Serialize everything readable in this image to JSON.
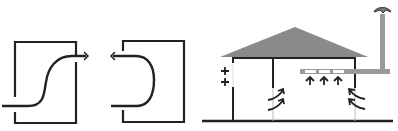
{
  "diagram": {
    "title": "",
    "panels": [
      {
        "id": "s-flow-box",
        "description": "Box with S-shaped airflow entering bottom-left and exiting top-right"
      },
      {
        "id": "u-turn-box",
        "description": "Box with U-shaped airflow entering and exiting the left side"
      },
      {
        "id": "house-ventilation",
        "description": "House with pitched roof, side wall vents, ceiling duct with grilles, chimney with rotating cowl and curved airflow arrows"
      }
    ],
    "colors": {
      "line": "#222222",
      "roof": "#8a8a8a",
      "duct": "#9a9a9a",
      "grille": "#ffffff",
      "background": "#ffffff",
      "thin_line": "#bbbbbb"
    },
    "labels": []
  }
}
